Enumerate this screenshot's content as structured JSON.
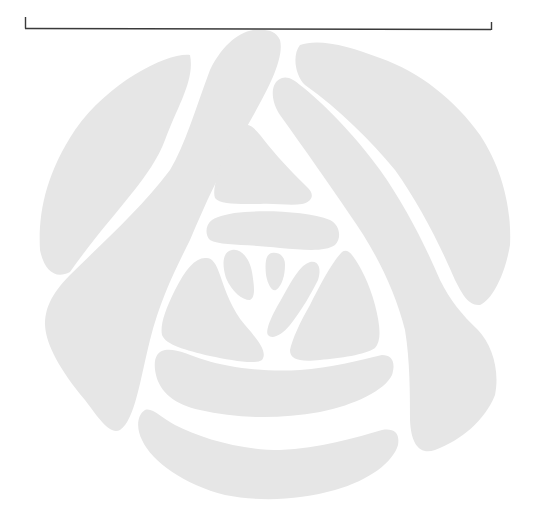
{
  "figure": {
    "colors": {
      "background": "#ffffff",
      "petal_fill": "#e6e6e6",
      "bracket_stroke": "#3a3a3a"
    },
    "bracket": {
      "left_x": 25,
      "right_x": 491,
      "baseline_y": 28,
      "left_top_y": 17,
      "right_top_y": 22
    },
    "emblem": {
      "center_x": 279,
      "center_y": 270,
      "radius": 245,
      "petal_count": 15
    }
  }
}
